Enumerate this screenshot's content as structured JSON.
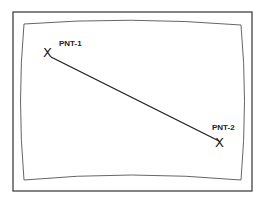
{
  "diagram": {
    "type": "crt-screen-line-between-points",
    "colors": {
      "frame": "#333333",
      "screen_edge": "#666666",
      "line": "#222222",
      "background": "#ffffff"
    },
    "points": [
      {
        "id": "pnt-1",
        "label": "PNT-1",
        "marker": "X",
        "x": 48,
        "y": 52,
        "label_x": 59,
        "label_y": 46
      },
      {
        "id": "pnt-2",
        "label": "PNT-2",
        "marker": "X",
        "x": 220,
        "y": 142,
        "label_x": 212,
        "label_y": 130
      }
    ],
    "line": {
      "from": "pnt-1",
      "to": "pnt-2"
    }
  }
}
